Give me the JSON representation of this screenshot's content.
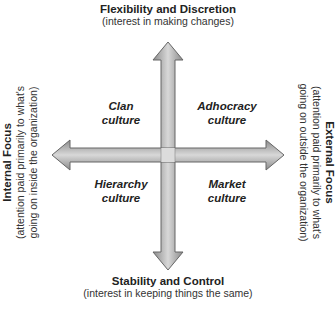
{
  "diagram": {
    "top": {
      "title": "Flexibility and Discretion",
      "subtitle": "(interest in making changes)"
    },
    "bottom": {
      "title": "Stability and Control",
      "subtitle": "(interest in keeping things the same)"
    },
    "left": {
      "title": "Internal Focus",
      "subtitle_line1": "(attention paid primarily to what's",
      "subtitle_line2": "going on inside the organization)"
    },
    "right": {
      "title": "External Focus",
      "subtitle_line1": "(attention paid primarily to what's",
      "subtitle_line2": "going on outside the organization)"
    },
    "quadrants": {
      "top_left": {
        "line1": "Clan",
        "line2": "culture"
      },
      "top_right": {
        "line1": "Adhocracy",
        "line2": "culture"
      },
      "bottom_left": {
        "line1": "Hierarchy",
        "line2": "culture"
      },
      "bottom_right": {
        "line1": "Market",
        "line2": "culture"
      }
    },
    "colors": {
      "arrow_fill": "#a8a8a8",
      "arrow_stroke": "#666666",
      "text": "#222222"
    }
  }
}
